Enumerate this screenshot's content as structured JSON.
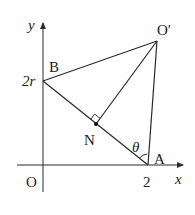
{
  "diagram": {
    "axes": {
      "x_label": "x",
      "y_label": "y",
      "origin_label": "O"
    },
    "ticks": {
      "x_tick": "2",
      "y_tick": "2r"
    },
    "points": {
      "B": "B",
      "O_prime": "O′",
      "N": "N",
      "A": "A"
    },
    "angle_label": "θ",
    "line_color": "#2a2a2a"
  }
}
